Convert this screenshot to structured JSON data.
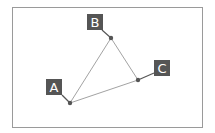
{
  "diagram": {
    "frame": {
      "x": 12.5,
      "y": 7.5,
      "w": 190,
      "h": 120,
      "stroke": "#9a9a9a"
    },
    "colors": {
      "label_bg": "#555555",
      "label_text": "#ffffff",
      "edge": "#8a8a8a",
      "point": "#555555"
    },
    "points": [
      {
        "id": "A",
        "label": "A",
        "x": 70,
        "y": 103,
        "lx": 46,
        "ly": 79
      },
      {
        "id": "B",
        "label": "B",
        "x": 111,
        "y": 38,
        "lx": 87,
        "ly": 14
      },
      {
        "id": "C",
        "label": "C",
        "x": 138,
        "y": 80,
        "lx": 154,
        "ly": 60
      }
    ],
    "edges": [
      [
        "A",
        "B"
      ],
      [
        "B",
        "C"
      ],
      [
        "C",
        "A"
      ]
    ]
  }
}
